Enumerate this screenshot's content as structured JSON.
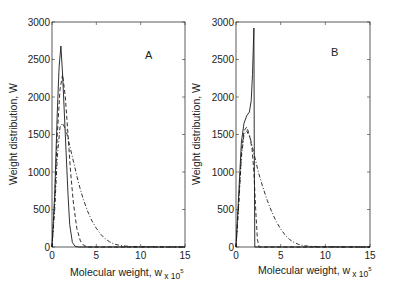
{
  "chart_data": [
    {
      "type": "line",
      "panel": "A",
      "title": "",
      "annotation": "A",
      "xlabel": "Molecular weight, w",
      "xlabel_multiplier": "x 10^5",
      "ylabel": "Weight distribution, W",
      "xlim": [
        0,
        15
      ],
      "ylim": [
        0,
        3000
      ],
      "xticks": [
        0,
        5,
        10,
        15
      ],
      "yticks": [
        0,
        500,
        1000,
        1500,
        2000,
        2500,
        3000
      ],
      "grid": false,
      "legend": null,
      "series": [
        {
          "name": "solid",
          "style": "solid",
          "x": [
            0,
            0.3,
            0.6,
            0.8,
            1.0,
            1.2,
            1.5,
            1.8,
            2.0,
            2.3,
            2.6,
            3.0,
            15
          ],
          "y": [
            0,
            700,
            1800,
            2400,
            2680,
            2300,
            1500,
            700,
            300,
            60,
            10,
            0,
            0
          ]
        },
        {
          "name": "dashed",
          "style": "dashed",
          "x": [
            0,
            0.3,
            0.6,
            0.9,
            1.2,
            1.5,
            1.8,
            2.1,
            2.4,
            2.8,
            3.2,
            3.6,
            4.0,
            15
          ],
          "y": [
            0,
            600,
            1500,
            2100,
            2300,
            2000,
            1500,
            1000,
            600,
            250,
            80,
            20,
            0,
            0
          ]
        },
        {
          "name": "dash-dot",
          "style": "dashdot",
          "x": [
            0,
            0.3,
            0.6,
            0.9,
            1.2,
            1.6,
            2.0,
            2.5,
            3.0,
            3.5,
            4.0,
            4.5,
            5.0,
            5.5,
            6.0,
            6.5,
            7.0,
            7.5,
            8.0,
            9.0,
            15
          ],
          "y": [
            0,
            500,
            1200,
            1600,
            1650,
            1550,
            1350,
            1100,
            850,
            650,
            480,
            350,
            250,
            170,
            110,
            70,
            40,
            25,
            15,
            5,
            0
          ]
        }
      ]
    },
    {
      "type": "line",
      "panel": "B",
      "title": "",
      "annotation": "B",
      "xlabel": "Molecular weight, w",
      "xlabel_multiplier": "x 10^5",
      "ylabel": "Weight distribution, W",
      "xlim": [
        0,
        15
      ],
      "ylim": [
        0,
        3000
      ],
      "xticks": [
        0,
        5,
        10,
        15
      ],
      "yticks": [
        0,
        500,
        1000,
        1500,
        2000,
        2500,
        3000
      ],
      "grid": false,
      "legend": null,
      "series": [
        {
          "name": "solid",
          "style": "solid",
          "x": [
            0,
            0.3,
            0.6,
            0.9,
            1.2,
            1.5,
            1.7,
            1.85,
            1.95,
            2.0,
            2.05,
            2.1,
            15
          ],
          "y": [
            0,
            700,
            1400,
            1650,
            1750,
            1800,
            1950,
            2300,
            2700,
            2920,
            1200,
            0,
            0
          ]
        },
        {
          "name": "dashed",
          "style": "dashed",
          "x": [
            0,
            0.3,
            0.6,
            0.9,
            1.2,
            1.5,
            1.8,
            2.0,
            2.2,
            2.4,
            2.6,
            15
          ],
          "y": [
            0,
            600,
            1250,
            1550,
            1600,
            1500,
            1300,
            1000,
            500,
            100,
            0,
            0
          ]
        },
        {
          "name": "dash-dot",
          "style": "dashdot",
          "x": [
            0,
            0.3,
            0.6,
            0.9,
            1.2,
            1.6,
            2.0,
            2.5,
            3.0,
            3.5,
            4.0,
            4.5,
            5.0,
            5.5,
            6.0,
            6.5,
            7.0,
            7.5,
            8.0,
            9.0,
            15
          ],
          "y": [
            0,
            550,
            1200,
            1500,
            1550,
            1450,
            1250,
            1000,
            800,
            620,
            470,
            340,
            240,
            160,
            100,
            60,
            35,
            20,
            12,
            4,
            0
          ]
        }
      ]
    }
  ],
  "panels": [
    {
      "annotation": "A",
      "ylabel": "Weight distribution, W",
      "xlabel": "Molecular weight, w",
      "xlabel_multiplier_base": "x 10",
      "xlabel_multiplier_exp": "5",
      "xtick_labels": [
        "0",
        "5",
        "10",
        "15"
      ],
      "ytick_labels": [
        "0",
        "500",
        "1000",
        "1500",
        "2000",
        "2500",
        "3000"
      ]
    },
    {
      "annotation": "B",
      "ylabel": "Weight distribution, W",
      "xlabel": "Molecular weight, w",
      "xlabel_multiplier_base": "x 10",
      "xlabel_multiplier_exp": "5",
      "xtick_labels": [
        "0",
        "5",
        "10",
        "15"
      ],
      "ytick_labels": [
        "0",
        "500",
        "1000",
        "1500",
        "2000",
        "2500",
        "3000"
      ]
    }
  ],
  "colors": {
    "line": "#1a1a1a",
    "axis": "#333333"
  }
}
